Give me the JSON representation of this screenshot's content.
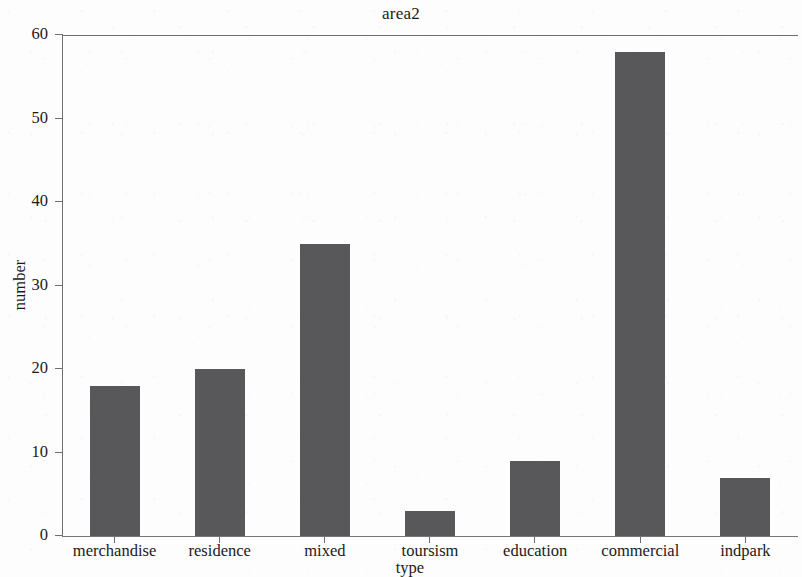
{
  "chart_data": {
    "type": "bar",
    "title": "area2",
    "xlabel": "type",
    "ylabel": "number",
    "categories": [
      "merchandise",
      "residence",
      "mixed",
      "toursism",
      "education",
      "commercial",
      "indpark"
    ],
    "values": [
      18,
      20,
      35,
      3,
      9,
      58,
      7
    ],
    "ylim": [
      0,
      60
    ],
    "y_ticks": [
      0,
      10,
      20,
      30,
      40,
      50,
      60
    ],
    "y_tick_labels": [
      "0",
      "10",
      "20",
      "30",
      "40",
      "50",
      "60"
    ],
    "grid": false,
    "legend": null,
    "bar_color": "#58585a",
    "axis_color": "#6f6f71",
    "background_color": "#fdfdfd"
  }
}
